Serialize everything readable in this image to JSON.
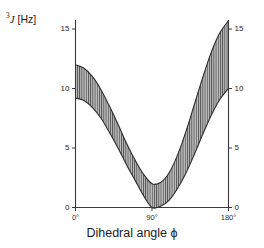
{
  "figure": {
    "background_color": "#ffffff",
    "axis_color": "#3a3a3a",
    "band_fill_color": "#b9b9b9",
    "band_edge_color": "#2b2b2b",
    "hatch_color": "#4a4a4a",
    "ylabel_prefix": "3",
    "ylabel_symbol": "J",
    "ylabel_unit": "[Hz]",
    "xlabel": "Dihedral angle",
    "xlabel_symbol": "ϕ"
  },
  "axes": {
    "y_ticks": [
      "15",
      "10",
      "5",
      "0"
    ],
    "y_tick_values": [
      15,
      10,
      5,
      0
    ],
    "x_ticks": [
      "0°",
      "90°",
      "180°"
    ],
    "x_tick_values": [
      0,
      90,
      180
    ]
  },
  "chart_data": {
    "type": "area",
    "title": "",
    "subtitle": "",
    "xlabel": "Dihedral angle ϕ",
    "ylabel": "3J [Hz]",
    "xlim": [
      0,
      180
    ],
    "ylim": [
      0,
      16.2
    ],
    "xtick_labels": [
      "0°",
      "90°",
      "180°"
    ],
    "xtick_values": [
      0,
      90,
      180
    ],
    "ytick_labels": [
      "0",
      "5",
      "10",
      "15"
    ],
    "ytick_values": [
      0,
      5,
      10,
      15
    ],
    "grid": false,
    "legend": false,
    "legend_position": "none",
    "annotations": [],
    "x": [
      0,
      10,
      20,
      30,
      40,
      50,
      60,
      70,
      80,
      90,
      100,
      110,
      120,
      130,
      140,
      150,
      160,
      170,
      180
    ],
    "series": [
      {
        "name": "upper bound",
        "values": [
          12.0,
          11.7,
          11.0,
          9.9,
          8.5,
          7.0,
          5.4,
          4.0,
          2.8,
          2.0,
          2.1,
          2.9,
          4.4,
          6.4,
          8.7,
          11.0,
          13.1,
          14.7,
          15.7
        ]
      },
      {
        "name": "lower bound",
        "values": [
          9.2,
          9.0,
          8.4,
          7.5,
          6.3,
          5.0,
          3.6,
          2.3,
          1.0,
          0.0,
          0.1,
          0.6,
          1.6,
          2.9,
          4.5,
          6.2,
          7.8,
          9.1,
          10.0
        ]
      }
    ],
    "fill_between": {
      "lower_series": "lower bound",
      "upper_series": "upper bound",
      "hatch": "vertical-lines",
      "fill_color": "#b9b9b9"
    }
  }
}
